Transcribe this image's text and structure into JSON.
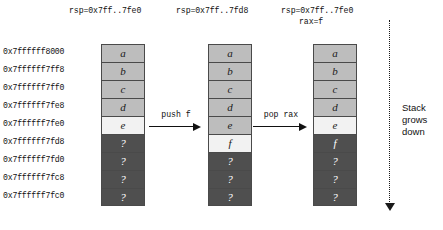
{
  "diagram": {
    "addresses": [
      "0x7ffffff8000",
      "0x7ffffff7ff8",
      "0x7ffffff7ff0",
      "0x7ffffff7fe8",
      "0x7ffffff7fe0",
      "0x7ffffff7fd8",
      "0x7ffffff7fd0",
      "0x7ffffff7fc8",
      "0x7ffffff7fc0"
    ],
    "columns": [
      {
        "id": "stack-before",
        "header": "rsp=0x7ff..7fe0",
        "header_line2": "",
        "cells": [
          {
            "value": "a",
            "state": "filled"
          },
          {
            "value": "b",
            "state": "filled"
          },
          {
            "value": "c",
            "state": "filled"
          },
          {
            "value": "d",
            "state": "filled"
          },
          {
            "value": "e",
            "state": "top"
          },
          {
            "value": "?",
            "state": "unknown"
          },
          {
            "value": "?",
            "state": "unknown"
          },
          {
            "value": "?",
            "state": "unknown"
          },
          {
            "value": "?",
            "state": "unknown"
          }
        ]
      },
      {
        "id": "stack-after-push",
        "header": "rsp=0x7ff..7fd8",
        "header_line2": "",
        "cells": [
          {
            "value": "a",
            "state": "filled"
          },
          {
            "value": "b",
            "state": "filled"
          },
          {
            "value": "c",
            "state": "filled"
          },
          {
            "value": "d",
            "state": "filled"
          },
          {
            "value": "e",
            "state": "filled"
          },
          {
            "value": "f",
            "state": "top"
          },
          {
            "value": "?",
            "state": "unknown"
          },
          {
            "value": "?",
            "state": "unknown"
          },
          {
            "value": "?",
            "state": "unknown"
          }
        ]
      },
      {
        "id": "stack-after-pop",
        "header": "rsp=0x7ff..7fe0",
        "header_line2": "rax=f",
        "cells": [
          {
            "value": "a",
            "state": "filled"
          },
          {
            "value": "b",
            "state": "filled"
          },
          {
            "value": "c",
            "state": "filled"
          },
          {
            "value": "d",
            "state": "filled"
          },
          {
            "value": "e",
            "state": "top"
          },
          {
            "value": "f",
            "state": "unknown"
          },
          {
            "value": "?",
            "state": "unknown"
          },
          {
            "value": "?",
            "state": "unknown"
          },
          {
            "value": "?",
            "state": "unknown"
          }
        ]
      }
    ],
    "transitions": [
      {
        "id": "push",
        "label": "push f"
      },
      {
        "id": "pop",
        "label": "pop rax"
      }
    ],
    "annotation": {
      "line1": "Stack",
      "line2": "grows",
      "line3": "down"
    },
    "colors": {
      "filled": "#bdbdbd",
      "top": "#f2f2f2",
      "unknown": "#4f4f4f",
      "border": "#4a4a4a",
      "text": "#111111"
    }
  }
}
